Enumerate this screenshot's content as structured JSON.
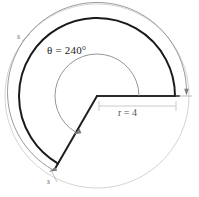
{
  "figure": {
    "type": "geometry-diagram",
    "background_color": "#ffffff",
    "labels": {
      "theta": "θ = 240°",
      "radius": "r = 4",
      "arc_length": "s",
      "arc_length_2": "s"
    },
    "colors": {
      "main_arc": "#1a1a1a",
      "radius_line": "#333333",
      "guide_arc": "#9a9a9a",
      "dimension_line": "#b0b0b0",
      "theta_arc": "#8a8a8a",
      "text": "#1a1a1a",
      "muted_text": "#6b6b6b"
    },
    "geometry": {
      "center_x": 97,
      "center_y": 96,
      "main_radius": 78,
      "outer_radius": 92,
      "theta_arc_radius": 42,
      "sector_angle_degrees": 240,
      "start_angle_degrees": 0,
      "end_angle_degrees": 240
    }
  }
}
